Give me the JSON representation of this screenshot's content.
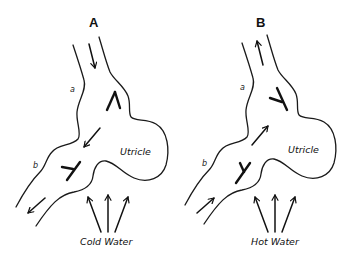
{
  "figure": {
    "panels": [
      {
        "id": "A",
        "title": "A",
        "canal_labels": [
          "a",
          "b"
        ],
        "chamber_label": "Utricle",
        "stimulus_label": "Cold Water",
        "flow_direction": "toward ampulla b (downward / out of utricle side)"
      },
      {
        "id": "B",
        "title": "B",
        "canal_labels": [
          "a",
          "b"
        ],
        "chamber_label": "Utricle",
        "stimulus_label": "Hot Water",
        "flow_direction": "toward canal a (upward / away from ampulla b)"
      }
    ],
    "colors": {
      "line": "#1a1a1a",
      "background": "#ffffff"
    }
  }
}
